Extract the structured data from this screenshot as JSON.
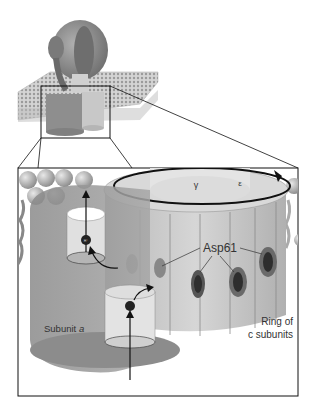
{
  "diagram": {
    "labels": {
      "subunit_a": "Subunit ",
      "subunit_a_italic": "a",
      "ring_line1": "Ring of",
      "ring_line2": "c subunits",
      "asp61": "Asp61",
      "gamma": "γ",
      "epsilon": "ε",
      "proton": "H⁺"
    },
    "colors": {
      "background": "#ffffff",
      "membrane": "#c9c9c9",
      "subunit_a": "#9a9a9a",
      "c_ring": "#c4c4c4",
      "asp_site": "#444444",
      "outline": "#111111"
    }
  }
}
